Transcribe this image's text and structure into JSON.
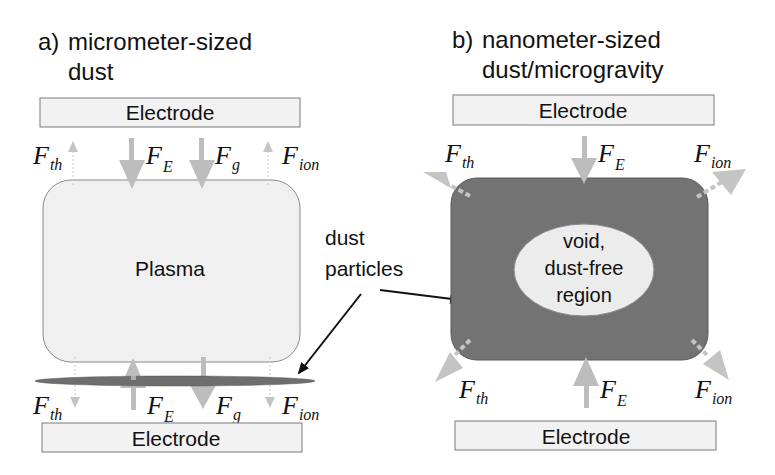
{
  "panel_a": {
    "label": "a)",
    "title_line1": "micrometer-sized",
    "title_line2": "dust",
    "top_electrode": "Electrode",
    "bottom_electrode": "Electrode",
    "plasma_label": "Plasma",
    "forces_top": [
      {
        "symbol": "F",
        "sub": "th",
        "direction": "up"
      },
      {
        "symbol": "F",
        "sub": "E",
        "direction": "down"
      },
      {
        "symbol": "F",
        "sub": "g",
        "direction": "down"
      },
      {
        "symbol": "F",
        "sub": "ion",
        "direction": "up"
      }
    ],
    "forces_bottom": [
      {
        "symbol": "F",
        "sub": "th",
        "direction": "down"
      },
      {
        "symbol": "F",
        "sub": "E",
        "direction": "up"
      },
      {
        "symbol": "F",
        "sub": "g",
        "direction": "down"
      },
      {
        "symbol": "F",
        "sub": "ion",
        "direction": "down"
      }
    ]
  },
  "panel_b": {
    "label": "b)",
    "title_line1": "nanometer-sized",
    "title_line2": "dust/microgravity",
    "top_electrode": "Electrode",
    "bottom_electrode": "Electrode",
    "void_line1": "void,",
    "void_line2": "dust-free",
    "void_line3": "region",
    "forces_top": [
      {
        "symbol": "F",
        "sub": "th",
        "direction": "up-left"
      },
      {
        "symbol": "F",
        "sub": "E",
        "direction": "down"
      },
      {
        "symbol": "F",
        "sub": "ion",
        "direction": "up-right"
      }
    ],
    "forces_bottom": [
      {
        "symbol": "F",
        "sub": "th",
        "direction": "down-left"
      },
      {
        "symbol": "F",
        "sub": "E",
        "direction": "up"
      },
      {
        "symbol": "F",
        "sub": "ion",
        "direction": "down-right"
      }
    ]
  },
  "callout": {
    "line1": "dust",
    "line2": "particles"
  },
  "colors": {
    "electrode_fill": "#f2f2f2",
    "electrode_stroke": "#7a7a7a",
    "plasma_fill": "#f0f0f0",
    "dust_fill": "#6e6e6e",
    "arrow_gray": "#bdbdbd",
    "void_fill": "#ececec",
    "text": "#111111"
  }
}
